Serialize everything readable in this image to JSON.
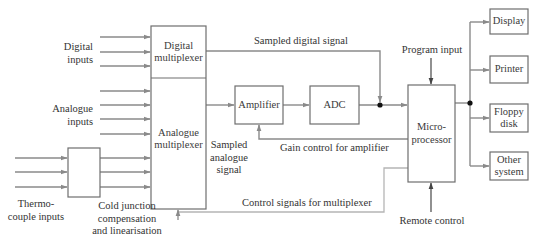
{
  "diagram": {
    "colors": {
      "line": "#8a8a8a",
      "box_border": "#6e6e6e",
      "text": "#333333",
      "junction": "#111111",
      "control_line": "#b5b5b5"
    },
    "inputs": {
      "digital": "Digital\ninputs",
      "analogue": "Analogue\ninputs",
      "thermocouple": "Thermo-\ncouple inputs"
    },
    "blocks": {
      "digital_mux": "Digital\nmultiplexer",
      "analogue_mux": "Analogue\nmultiplexer",
      "cjc": "",
      "amplifier": "Amplifier",
      "adc": "ADC",
      "microprocessor": "Micro-\nprocessor",
      "display": "Display",
      "printer": "Printer",
      "floppy": "Floppy\ndisk",
      "other": "Other\nsystem"
    },
    "labels": {
      "cjc_caption": "Cold junction\ncompensation\nand linearisation",
      "sampled_digital": "Sampled digital signal",
      "sampled_analogue": "Sampled\nanalogue\nsignal",
      "gain_control": "Gain control for amplifier",
      "control_signals": "Control signals for multiplexer",
      "program_input": "Program input",
      "remote_control": "Remote control"
    }
  }
}
